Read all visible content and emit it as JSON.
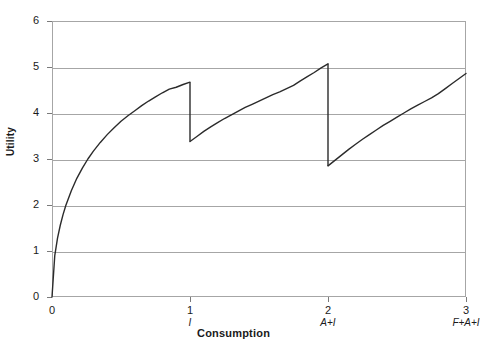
{
  "chart_data": {
    "type": "line",
    "title": "",
    "xlabel": "Consumption",
    "ylabel": "Utility",
    "xlim": [
      0,
      3
    ],
    "ylim": [
      0,
      6
    ],
    "grid": true,
    "legend": false,
    "legend_position": "none",
    "x_ticks": [
      {
        "value": 0,
        "label": "0",
        "sublabel": ""
      },
      {
        "value": 1,
        "label": "1",
        "sublabel": "I"
      },
      {
        "value": 2,
        "label": "2",
        "sublabel": "A+I"
      },
      {
        "value": 3,
        "label": "3",
        "sublabel": "F+A+I"
      }
    ],
    "y_ticks": [
      {
        "value": 0,
        "label": "0"
      },
      {
        "value": 1,
        "label": "1"
      },
      {
        "value": 2,
        "label": "2"
      },
      {
        "value": 3,
        "label": "3"
      },
      {
        "value": 4,
        "label": "4"
      },
      {
        "value": 5,
        "label": "5"
      },
      {
        "value": 6,
        "label": "6"
      }
    ],
    "line_color": "#2b2b2b",
    "grid_color": "#a6a6a6",
    "series": [
      {
        "name": "utility",
        "segments": [
          {
            "name": "segment-1",
            "x_start": 0,
            "x_end": 1,
            "y_start": 0,
            "y_end": 4.67,
            "points": [
              [
                0.0,
                0.0
              ],
              [
                0.02,
                0.9
              ],
              [
                0.04,
                1.28
              ],
              [
                0.06,
                1.56
              ],
              [
                0.08,
                1.79
              ],
              [
                0.1,
                1.99
              ],
              [
                0.14,
                2.31
              ],
              [
                0.18,
                2.58
              ],
              [
                0.22,
                2.8
              ],
              [
                0.26,
                3.0
              ],
              [
                0.3,
                3.17
              ],
              [
                0.35,
                3.36
              ],
              [
                0.4,
                3.53
              ],
              [
                0.45,
                3.68
              ],
              [
                0.5,
                3.82
              ],
              [
                0.55,
                3.94
              ],
              [
                0.6,
                4.05
              ],
              [
                0.65,
                4.16
              ],
              [
                0.7,
                4.26
              ],
              [
                0.75,
                4.35
              ],
              [
                0.8,
                4.44
              ],
              [
                0.85,
                4.52
              ],
              [
                0.9,
                4.56
              ],
              [
                0.95,
                4.62
              ],
              [
                1.0,
                4.67
              ]
            ]
          },
          {
            "name": "drop-1",
            "x": 1,
            "y_from": 4.67,
            "y_to": 3.38
          },
          {
            "name": "segment-2",
            "x_start": 1,
            "x_end": 2,
            "y_start": 3.38,
            "y_end": 5.07,
            "points": [
              [
                1.0,
                3.38
              ],
              [
                1.05,
                3.49
              ],
              [
                1.1,
                3.6
              ],
              [
                1.15,
                3.7
              ],
              [
                1.2,
                3.79
              ],
              [
                1.25,
                3.88
              ],
              [
                1.3,
                3.96
              ],
              [
                1.35,
                4.04
              ],
              [
                1.4,
                4.12
              ],
              [
                1.45,
                4.19
              ],
              [
                1.5,
                4.26
              ],
              [
                1.55,
                4.33
              ],
              [
                1.6,
                4.4
              ],
              [
                1.65,
                4.46
              ],
              [
                1.7,
                4.53
              ],
              [
                1.75,
                4.6
              ],
              [
                1.8,
                4.7
              ],
              [
                1.85,
                4.79
              ],
              [
                1.9,
                4.88
              ],
              [
                1.95,
                4.98
              ],
              [
                2.0,
                5.07
              ]
            ]
          },
          {
            "name": "drop-2",
            "x": 2,
            "y_from": 5.07,
            "y_to": 2.85
          },
          {
            "name": "segment-3",
            "x_start": 2,
            "x_end": 3,
            "y_start": 2.85,
            "y_end": 4.86,
            "points": [
              [
                2.0,
                2.85
              ],
              [
                2.05,
                2.97
              ],
              [
                2.1,
                3.09
              ],
              [
                2.15,
                3.21
              ],
              [
                2.2,
                3.32
              ],
              [
                2.25,
                3.43
              ],
              [
                2.3,
                3.53
              ],
              [
                2.35,
                3.63
              ],
              [
                2.4,
                3.73
              ],
              [
                2.45,
                3.82
              ],
              [
                2.5,
                3.91
              ],
              [
                2.55,
                4.0
              ],
              [
                2.6,
                4.09
              ],
              [
                2.65,
                4.17
              ],
              [
                2.7,
                4.25
              ],
              [
                2.75,
                4.33
              ],
              [
                2.8,
                4.42
              ],
              [
                2.85,
                4.53
              ],
              [
                2.9,
                4.64
              ],
              [
                2.95,
                4.75
              ],
              [
                3.0,
                4.86
              ]
            ]
          }
        ]
      }
    ]
  }
}
